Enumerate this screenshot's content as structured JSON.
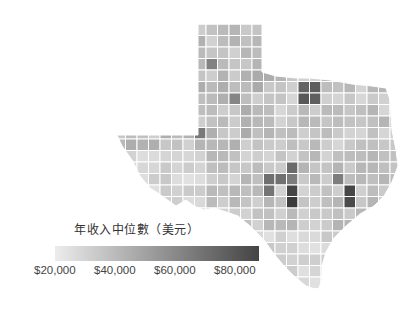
{
  "legend": {
    "title": "年收入中位數（美元）",
    "gradient": {
      "low_color": "#ececec",
      "high_color": "#444444"
    },
    "ticks": [
      {
        "label": "$20,000",
        "value": 20000
      },
      {
        "label": "$40,000",
        "value": 40000
      },
      {
        "label": "$60,000",
        "value": 60000
      },
      {
        "label": "$80,000",
        "value": 80000
      }
    ],
    "range": [
      15000,
      95000
    ]
  },
  "map": {
    "region": "Texas",
    "unit": "county",
    "metric": "median household income",
    "border_color": "#ffffff",
    "highlights": [
      {
        "area": "Dallas–Fort Worth metro",
        "shade": "#505050"
      },
      {
        "area": "Houston metro",
        "shade": "#3a3a3a"
      },
      {
        "area": "Austin metro",
        "shade": "#6a6a6a"
      },
      {
        "area": "San Antonio area",
        "shade": "#7a7a7a"
      }
    ]
  }
}
